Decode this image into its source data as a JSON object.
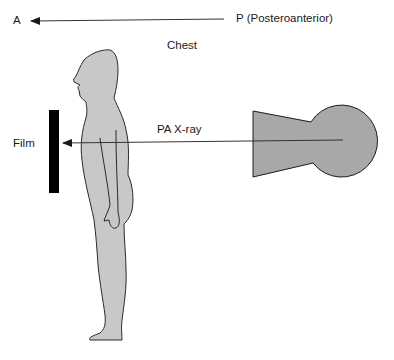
{
  "diagram": {
    "labels": {
      "anterior": "A",
      "posterior": "P (Posteroanterior)",
      "region": "Chest",
      "beam": "PA X-ray",
      "film": "Film"
    },
    "elements": {
      "direction_arrow": {
        "from": "P",
        "to": "A"
      },
      "beam_arrow": {
        "from": "x-ray-tube",
        "to": "film"
      }
    },
    "colors": {
      "body_fill": "#c8c8c8",
      "tube_fill": "#a8a8a8",
      "outline": "#2a2a2a",
      "film": "#000000",
      "text": "#1a1a1a"
    }
  }
}
